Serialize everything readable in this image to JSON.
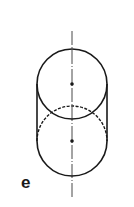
{
  "figure": {
    "label": "e",
    "colors": {
      "stroke": "#1a1a1a",
      "background": "#ffffff"
    },
    "axis": {
      "x": 72,
      "y1": 31,
      "y2": 197
    },
    "top_circle": {
      "cx": 72,
      "cy": 84,
      "r": 35
    },
    "bottom_circle": {
      "cx": 72,
      "cy": 141,
      "r": 35
    },
    "centers": [
      {
        "x": 72,
        "y": 84
      },
      {
        "x": 72,
        "y": 141
      }
    ]
  }
}
